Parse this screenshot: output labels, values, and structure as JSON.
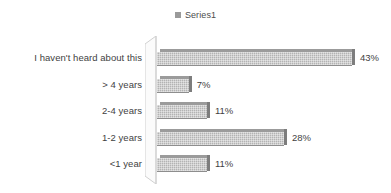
{
  "chart_data": {
    "type": "bar",
    "orientation": "horizontal",
    "title": "",
    "xlabel": "",
    "ylabel": "",
    "grid": false,
    "legend_position": "top-center",
    "xlim": [
      0,
      50
    ],
    "categories": [
      "I haven't heard about this",
      "> 4 years",
      "2-4 years",
      "1-2 years",
      "<1 year"
    ],
    "values": [
      43,
      7,
      11,
      28,
      11
    ],
    "data_labels": [
      "43%",
      "7%",
      "11%",
      "28%",
      "11%"
    ],
    "series": [
      {
        "name": "Series1",
        "values": [
          43,
          7,
          11,
          28,
          11
        ]
      }
    ]
  },
  "legend": {
    "entries": [
      {
        "label": "Series1",
        "swatch_icon": "legend-swatch-icon",
        "color": "#9a9a9a"
      }
    ]
  },
  "colors": {
    "bar_fill": "#b3b3b3",
    "bar_top": "#9b9b9b",
    "bar_cap": "#7d7d7d",
    "axis_wall": "#d4d4d4",
    "text": "#3f3f3f",
    "background": "#ffffff"
  }
}
